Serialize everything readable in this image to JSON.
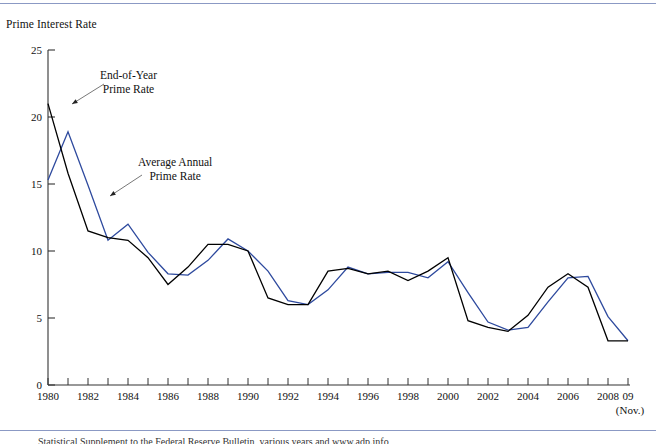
{
  "chart_data": {
    "type": "line",
    "title": "Prime Interest Rate",
    "ylabel": "Prime Interest Rate",
    "xlabel": "",
    "ylim": [
      0,
      25
    ],
    "xlim": [
      1980,
      2009
    ],
    "grid": false,
    "legend_position": "inline-annotations",
    "ytick_labels": [
      "0",
      "5",
      "10",
      "15",
      "20",
      "25"
    ],
    "ytick_values": [
      0,
      5,
      10,
      15,
      20,
      25
    ],
    "xtick_labels": [
      "1980",
      "1982",
      "1984",
      "1986",
      "1988",
      "1990",
      "1992",
      "1994",
      "1996",
      "1998",
      "2000",
      "2002",
      "2004",
      "2006",
      "2008",
      "09"
    ],
    "xtick_values": [
      1980,
      1982,
      1984,
      1986,
      1988,
      1990,
      1992,
      1994,
      1996,
      1998,
      2000,
      2002,
      2004,
      2006,
      2008,
      2009
    ],
    "xtick_minor_values": [
      1981,
      1983,
      1985,
      1987,
      1989,
      1991,
      1993,
      1995,
      1997,
      1999,
      2001,
      2003,
      2005,
      2007
    ],
    "x_axis_note": "(Nov.)",
    "x": [
      1980,
      1981,
      1982,
      1983,
      1984,
      1985,
      1986,
      1987,
      1988,
      1989,
      1990,
      1991,
      1992,
      1993,
      1994,
      1995,
      1996,
      1997,
      1998,
      1999,
      2000,
      2001,
      2002,
      2003,
      2004,
      2005,
      2006,
      2007,
      2008,
      2009
    ],
    "series": [
      {
        "name": "End-of-Year Prime Rate",
        "color": "#000000",
        "values": [
          21.0,
          15.8,
          11.5,
          11.0,
          10.8,
          9.5,
          7.5,
          8.8,
          10.5,
          10.5,
          10.0,
          6.5,
          6.0,
          6.0,
          8.5,
          8.7,
          8.3,
          8.5,
          7.8,
          8.5,
          9.5,
          4.8,
          4.3,
          4.0,
          5.2,
          7.3,
          8.3,
          7.3,
          3.3,
          3.3
        ]
      },
      {
        "name": "Average Annual Prime Rate",
        "color": "#2e4a9e",
        "values": [
          15.3,
          18.9,
          14.9,
          10.8,
          12.0,
          9.9,
          8.3,
          8.2,
          9.3,
          10.9,
          10.0,
          8.5,
          6.3,
          6.0,
          7.1,
          8.8,
          8.3,
          8.4,
          8.4,
          8.0,
          9.2,
          6.9,
          4.7,
          4.1,
          4.3,
          6.2,
          8.0,
          8.1,
          5.1,
          3.3
        ]
      }
    ],
    "annotations": [
      {
        "id": "eoy",
        "text_line1": "End-of-Year",
        "text_line2": "Prime Rate",
        "target_series": "End-of-Year Prime Rate"
      },
      {
        "id": "avg",
        "text_line1": "Average Annual",
        "text_line2": "Prime Rate",
        "target_series": "Average Annual Prime Rate"
      }
    ]
  },
  "colors": {
    "rule": "#8b99c4",
    "axis": "#333333",
    "eoy_line": "#000000",
    "avg_line": "#2e4a9e",
    "text": "#111111"
  },
  "source": {
    "text": "Statistical Supplement to the Federal Reserve Bulletin, various years and www.adp.info"
  }
}
